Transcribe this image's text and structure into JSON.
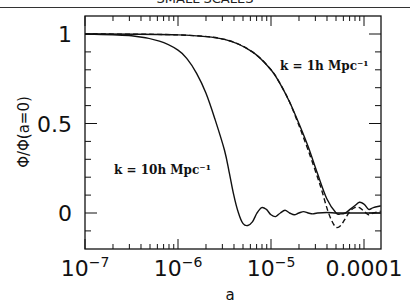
{
  "header": {
    "title": "SMALL SCALES"
  },
  "chart_data": {
    "type": "line",
    "title": "",
    "xlabel": "a",
    "ylabel": "Φ/Φ(a=0)",
    "xscale": "log",
    "xlim": [
      1e-07,
      0.00015
    ],
    "ylim": [
      -0.13,
      1.1
    ],
    "x_tick_labels": [
      "10^-7",
      "10^-6",
      "10^-5",
      "0.0001"
    ],
    "y_tick_labels": [
      "0",
      "0.5",
      "1"
    ],
    "grid": false,
    "legend": "none",
    "annotations": [
      {
        "text": "k = 1h Mpc⁻¹",
        "near_log_a": -4.7,
        "near_value": 0.93
      },
      {
        "text": "k = 10h Mpc⁻¹",
        "near_log_a": -6.6,
        "near_value": 0.25
      }
    ],
    "series": [
      {
        "name": "k = 10h Mpc-1 (solid)",
        "style": "solid",
        "log_a": [
          -7.0,
          -6.5,
          -6.2,
          -6.0,
          -5.9,
          -5.8,
          -5.7,
          -5.6,
          -5.5,
          -5.45,
          -5.4,
          -5.35,
          -5.3,
          -5.25,
          -5.2,
          -5.15,
          -5.1,
          -5.05,
          -5.0,
          -4.95,
          -4.9,
          -4.85,
          -4.8,
          -4.75,
          -4.7,
          -4.65,
          -4.6,
          -4.55,
          -4.5,
          -4.4,
          -4.3,
          -4.2,
          -4.1,
          -4.0,
          -3.9,
          -3.82
        ],
        "values": [
          1.0,
          0.99,
          0.96,
          0.91,
          0.86,
          0.78,
          0.67,
          0.52,
          0.35,
          0.23,
          0.1,
          0.0,
          -0.06,
          -0.07,
          -0.05,
          0.0,
          0.03,
          0.02,
          -0.01,
          -0.02,
          0.0,
          0.015,
          0.0,
          -0.01,
          0.0,
          0.008,
          0.0,
          -0.005,
          0.0,
          0.003,
          0.0,
          0.0,
          0.0,
          0.0,
          0.0,
          0.0
        ]
      },
      {
        "name": "k = 1h Mpc-1 (solid)",
        "style": "solid",
        "log_a": [
          -7.0,
          -6.0,
          -5.5,
          -5.2,
          -5.0,
          -4.9,
          -4.8,
          -4.7,
          -4.6,
          -4.5,
          -4.4,
          -4.3,
          -4.25,
          -4.2,
          -4.15,
          -4.1,
          -4.05,
          -4.0,
          -3.95,
          -3.9,
          -3.82
        ],
        "values": [
          1.0,
          0.995,
          0.97,
          0.9,
          0.8,
          0.72,
          0.62,
          0.5,
          0.37,
          0.22,
          0.08,
          0.0,
          -0.005,
          0.0,
          0.02,
          0.04,
          0.06,
          0.05,
          0.02,
          0.03,
          0.04
        ]
      },
      {
        "name": "k = 1h Mpc-1 (dashed)",
        "style": "dashed",
        "log_a": [
          -7.0,
          -6.0,
          -5.5,
          -5.2,
          -5.0,
          -4.9,
          -4.8,
          -4.7,
          -4.6,
          -4.5,
          -4.45,
          -4.4,
          -4.35,
          -4.3,
          -4.25,
          -4.2,
          -4.15,
          -4.1,
          -4.05,
          -4.0,
          -3.95,
          -3.9,
          -3.82
        ],
        "values": [
          1.0,
          0.995,
          0.97,
          0.9,
          0.8,
          0.72,
          0.62,
          0.49,
          0.35,
          0.2,
          0.12,
          0.03,
          -0.04,
          -0.08,
          -0.07,
          -0.03,
          0.01,
          0.03,
          0.03,
          0.01,
          -0.01,
          0.0,
          0.01
        ]
      }
    ]
  }
}
